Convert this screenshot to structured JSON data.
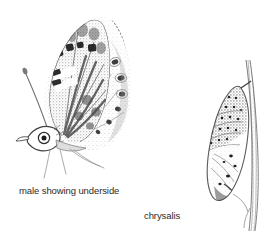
{
  "plate": {
    "background_color": "#ffffff",
    "width": 265,
    "height": 237,
    "style": "pen-and-ink stipple natural history illustration",
    "ink_color": "#3a3a3a"
  },
  "captions": {
    "male": "male showing underside",
    "chrysalis": "chrysalis"
  },
  "figures": [
    {
      "id": "butterfly",
      "name": "butterfly-underside",
      "label": "male showing underside",
      "parts": [
        "antenna",
        "head",
        "eye",
        "palpus",
        "forewing",
        "hindwing",
        "legs",
        "wing-spots"
      ]
    },
    {
      "id": "chrysalis",
      "name": "chrysalis-on-twig",
      "label": "chrysalis",
      "parts": [
        "twig",
        "cremaster",
        "abdomen-segments",
        "wing-case",
        "head-case"
      ]
    }
  ]
}
